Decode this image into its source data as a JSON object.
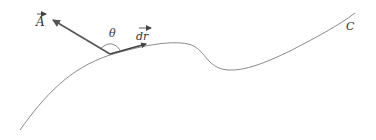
{
  "diagram": {
    "labels": {
      "vector_field": "A",
      "angle": "θ",
      "displacement": "dr",
      "curve": "C"
    },
    "colors": {
      "curve": "#8a8a8a",
      "vector": "#555555",
      "text": "#333333",
      "background": "#ffffff"
    }
  }
}
